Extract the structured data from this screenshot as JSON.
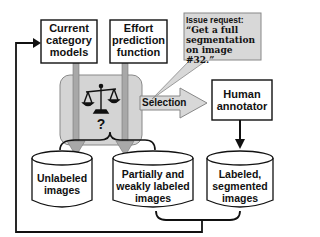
{
  "diagram": {
    "boxes": {
      "category_models": {
        "lines": [
          "Current",
          "category",
          "models"
        ]
      },
      "effort_function": {
        "lines": [
          "Effort",
          "prediction",
          "function"
        ]
      },
      "human_annotator": {
        "lines": [
          "Human",
          "annotator"
        ]
      }
    },
    "callout": {
      "title": "Issue request:",
      "lines": [
        "“Get a full",
        "segmentation",
        "on image #32.”"
      ]
    },
    "selector": {
      "icon": "balance-scale-icon",
      "question": "?"
    },
    "selection_arrow": {
      "label": "Selection"
    },
    "databases": {
      "unlabeled": {
        "lines": [
          "Unlabeled",
          "images"
        ]
      },
      "partial": {
        "lines": [
          "Partially and",
          "weakly labeled",
          "images"
        ]
      },
      "labeled": {
        "lines": [
          "Labeled,",
          "segmented",
          "images"
        ]
      }
    },
    "colors": {
      "gray_box": "#d4d4d4",
      "gray_arrow": "#a8a8a8",
      "callout_bg": "#d8d8d8",
      "line": "#111111"
    }
  }
}
